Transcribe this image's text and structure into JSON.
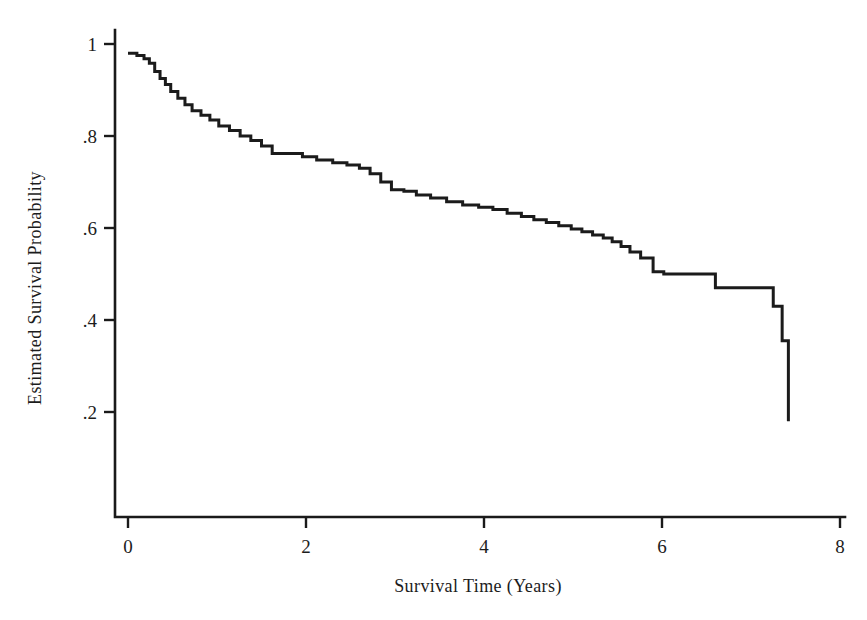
{
  "figure": {
    "title": "",
    "background_color": "#ffffff",
    "line_color": "#1b1b1b"
  },
  "axes": {
    "x": {
      "label": "Survival Time (Years)",
      "ticks": [
        0,
        2,
        4,
        6,
        8
      ],
      "tick_labels": [
        "0",
        "2",
        "4",
        "6",
        "8"
      ],
      "range": [
        0,
        8
      ]
    },
    "y": {
      "label": "Estimated Survival Probability",
      "ticks": [
        1,
        0.8,
        0.6,
        0.4,
        0.2
      ],
      "tick_labels": [
        "1",
        ".8",
        ".6",
        ".4",
        ".2"
      ],
      "range": [
        0,
        1.02
      ]
    }
  },
  "chart_data": {
    "type": "line",
    "subtype": "kaplan-meier-step",
    "title": "",
    "xlabel": "Survival Time (Years)",
    "ylabel": "Estimated Survival Probability",
    "xlim": [
      0,
      8
    ],
    "ylim": [
      0,
      1.02
    ],
    "xticks": [
      0,
      2,
      4,
      6,
      8
    ],
    "yticks": [
      0.2,
      0.4,
      0.6,
      0.8,
      1
    ],
    "ytick_labels": [
      ".2",
      ".4",
      ".6",
      ".8",
      "1"
    ],
    "grid": false,
    "legend": null,
    "series": [
      {
        "name": "Estimated Survival Probability",
        "color": "#1b1b1b",
        "step": "post",
        "x": [
          0.0,
          0.1,
          0.18,
          0.24,
          0.3,
          0.36,
          0.42,
          0.48,
          0.56,
          0.64,
          0.72,
          0.82,
          0.92,
          1.02,
          1.14,
          1.26,
          1.38,
          1.5,
          1.62,
          1.96,
          2.12,
          2.3,
          2.46,
          2.6,
          2.72,
          2.84,
          2.96,
          3.1,
          3.24,
          3.4,
          3.58,
          3.76,
          3.94,
          4.1,
          4.26,
          4.42,
          4.56,
          4.7,
          4.84,
          4.98,
          5.1,
          5.22,
          5.34,
          5.44,
          5.54,
          5.64,
          5.76,
          5.9,
          6.02,
          6.6,
          7.25,
          7.35,
          7.42
        ],
        "y": [
          0.98,
          0.975,
          0.968,
          0.958,
          0.94,
          0.925,
          0.912,
          0.897,
          0.882,
          0.868,
          0.855,
          0.845,
          0.835,
          0.822,
          0.812,
          0.8,
          0.79,
          0.778,
          0.762,
          0.755,
          0.748,
          0.742,
          0.737,
          0.73,
          0.718,
          0.7,
          0.683,
          0.68,
          0.672,
          0.665,
          0.657,
          0.65,
          0.645,
          0.64,
          0.632,
          0.625,
          0.618,
          0.612,
          0.605,
          0.598,
          0.592,
          0.585,
          0.578,
          0.57,
          0.56,
          0.548,
          0.535,
          0.505,
          0.5,
          0.47,
          0.43,
          0.355,
          0.18
        ]
      }
    ],
    "annotations": []
  }
}
